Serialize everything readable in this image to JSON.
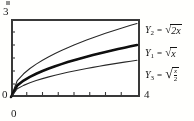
{
  "figure": {
    "kind": "graphing-calculator-window",
    "window": {
      "xmin_label": "0",
      "xmax_label": "4",
      "ymin_label": "0",
      "ymax_label": "3"
    }
  },
  "legend": {
    "entries": [
      {
        "name": "Y2",
        "var_base": "Y",
        "var_sub": "2",
        "equals": "=",
        "expression": "√(2x)",
        "radicand": "2x",
        "weight": "thin"
      },
      {
        "name": "Y1",
        "var_base": "Y",
        "var_sub": "1",
        "equals": "=",
        "expression": "√x",
        "radicand": "x",
        "weight": "bold"
      },
      {
        "name": "Y3",
        "var_base": "Y",
        "var_sub": "3",
        "equals": "=",
        "expression": "√(x/2)",
        "radicand_num": "x",
        "radicand_den": "2",
        "weight": "thin"
      }
    ]
  },
  "chart_data": {
    "type": "line",
    "title": "",
    "xlabel": "",
    "ylabel": "",
    "xlim": [
      0,
      4
    ],
    "ylim": [
      0,
      3
    ],
    "xticks": [
      0,
      0.5,
      1,
      1.5,
      2,
      2.5,
      3,
      3.5,
      4
    ],
    "yticks": [
      0,
      0.5,
      1,
      1.5,
      2,
      2.5,
      3
    ],
    "grid": false,
    "legend_position": "right-outside",
    "x": [
      0,
      0.2,
      0.4,
      0.6,
      0.8,
      1,
      1.2,
      1.4,
      1.6,
      1.8,
      2,
      2.2,
      2.4,
      2.6,
      2.8,
      3,
      3.2,
      3.4,
      3.6,
      3.8,
      4
    ],
    "series": [
      {
        "name": "Y2 = √(2x)",
        "formula": "sqrt(2x)",
        "style": "thin",
        "color": "#2b2b2b",
        "values": [
          0,
          0.632,
          0.894,
          1.095,
          1.265,
          1.414,
          1.549,
          1.673,
          1.789,
          1.897,
          2.0,
          2.098,
          2.191,
          2.28,
          2.366,
          2.449,
          2.53,
          2.608,
          2.683,
          2.757,
          2.828
        ]
      },
      {
        "name": "Y1 = √x",
        "formula": "sqrt(x)",
        "style": "bold",
        "color": "#111111",
        "values": [
          0,
          0.447,
          0.632,
          0.775,
          0.894,
          1.0,
          1.095,
          1.183,
          1.265,
          1.342,
          1.414,
          1.483,
          1.549,
          1.612,
          1.673,
          1.732,
          1.789,
          1.844,
          1.897,
          1.949,
          2.0
        ]
      },
      {
        "name": "Y3 = √(x/2)",
        "formula": "sqrt(x/2)",
        "style": "thin",
        "color": "#2b2b2b",
        "values": [
          0,
          0.316,
          0.447,
          0.548,
          0.632,
          0.707,
          0.775,
          0.837,
          0.894,
          0.949,
          1.0,
          1.049,
          1.095,
          1.14,
          1.183,
          1.225,
          1.265,
          1.304,
          1.342,
          1.378,
          1.414
        ]
      }
    ]
  }
}
